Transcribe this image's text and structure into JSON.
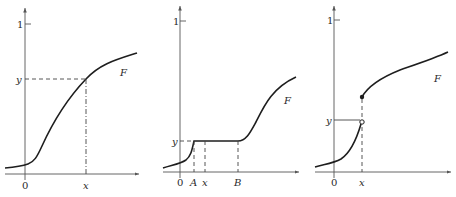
{
  "figure": {
    "panels": [
      {
        "id": "continuous-cdf",
        "axis_tick_one": "1",
        "origin_label": "0",
        "x_label": "x",
        "y_label": "y",
        "curve_label": "F"
      },
      {
        "id": "flat-segment-cdf",
        "axis_tick_one": "1",
        "origin_label": "0",
        "a_label": "A",
        "x_label": "x",
        "b_label": "B",
        "y_label": "y",
        "curve_label": "F"
      },
      {
        "id": "jump-cdf",
        "axis_tick_one": "1",
        "origin_label": "0",
        "x_label": "x",
        "y_label": "y",
        "curve_label": "F"
      }
    ]
  },
  "colors": {
    "curve": "#1e1e1e",
    "axis": "#555555",
    "background": "#ffffff"
  }
}
